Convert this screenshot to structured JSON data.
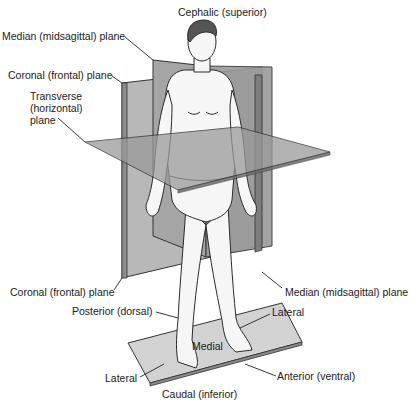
{
  "diagram": {
    "colors": {
      "plane_light": "#c9c9c9",
      "plane_mid": "#a8a8a8",
      "plane_dark": "#8a8a8a",
      "outline": "#2a2a2a",
      "skin": "#f4f4f4",
      "hair": "#555555",
      "leader": "#222222"
    },
    "labels": {
      "cephalic": "Cephalic (superior)",
      "median_top": "Median (midsagittal) plane",
      "coronal_top": "Coronal (frontal) plane",
      "transverse_1": "Transverse",
      "transverse_2": "(horizontal)",
      "transverse_3": "plane",
      "coronal_bottom": "Coronal (frontal) plane",
      "median_bottom": "Median (midsagittal) plane",
      "posterior": "Posterior (dorsal)",
      "lateral_right": "Lateral",
      "medial": "Medial",
      "lateral_left": "Lateral",
      "anterior": "Anterior (ventral)",
      "caudal": "Caudal (inferior)"
    }
  }
}
